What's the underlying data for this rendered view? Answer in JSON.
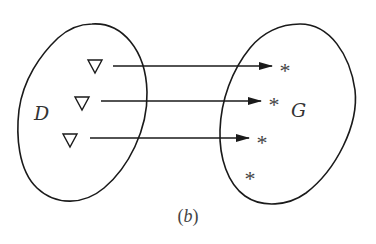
{
  "diagram": {
    "caption": "(b)",
    "domain_set": {
      "label": "D",
      "element_symbol": "▽",
      "element_count": 3
    },
    "codomain_set": {
      "label": "G",
      "element_symbol": "*",
      "element_count": 4
    },
    "mappings": [
      {
        "from": 0,
        "to": 0
      },
      {
        "from": 1,
        "to": 1
      },
      {
        "from": 2,
        "to": 2
      }
    ],
    "unmapped_codomain_elements": [
      3
    ],
    "colors": {
      "stroke": "#1a1a1a",
      "text": "#333333",
      "background": "#ffffff"
    }
  },
  "labels": {
    "domain": "D",
    "codomain": "G",
    "caption_open": "(",
    "caption_letter": "b",
    "caption_close": ")",
    "star": "*"
  }
}
